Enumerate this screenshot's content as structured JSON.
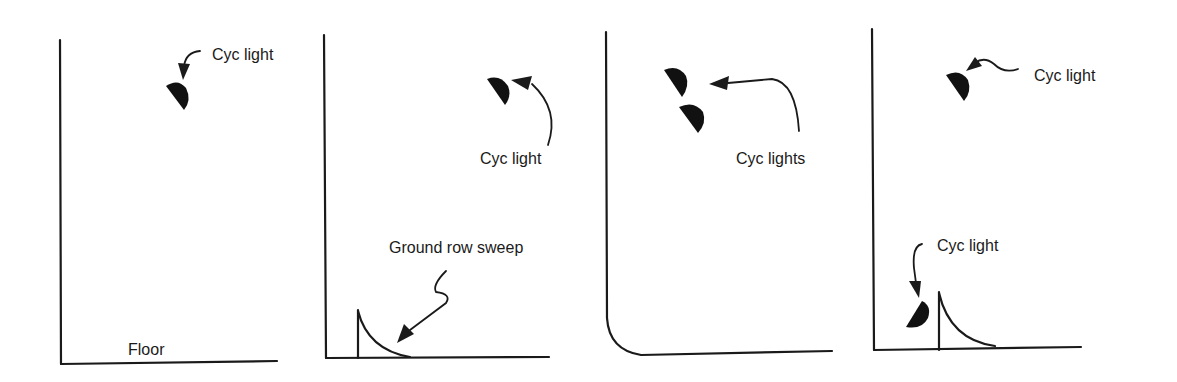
{
  "figure": {
    "colors": {
      "ink": "#1a1a1a",
      "background": "#ffffff"
    },
    "panels": [
      {
        "id": 1,
        "labels": {
          "cyc_light": "Cyc light",
          "floor": "Floor"
        },
        "elements": [
          "wall",
          "floor",
          "overhead-cyc-light"
        ]
      },
      {
        "id": 2,
        "labels": {
          "cyc_light": "Cyc light",
          "ground_row": "Ground row sweep"
        },
        "elements": [
          "wall",
          "floor",
          "overhead-cyc-light",
          "ground-row-sweep"
        ]
      },
      {
        "id": 3,
        "labels": {
          "cyc_lights": "Cyc lights"
        },
        "elements": [
          "curved-wall-floor",
          "two-overhead-cyc-lights"
        ]
      },
      {
        "id": 4,
        "labels": {
          "cyc_light_top": "Cyc light",
          "cyc_light_bottom": "Cyc light"
        },
        "elements": [
          "wall",
          "floor",
          "overhead-cyc-light",
          "floor-cyc-light",
          "ground-row-sweep"
        ]
      }
    ]
  }
}
